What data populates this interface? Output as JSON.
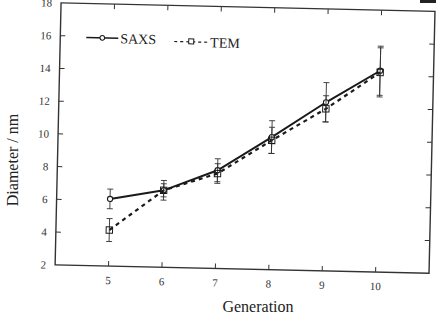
{
  "chart_data": {
    "type": "line",
    "title": "",
    "xlabel": "Generation",
    "ylabel": "Diameter / nm",
    "x": [
      5,
      6,
      7,
      8,
      9,
      10
    ],
    "xlim": [
      4,
      11
    ],
    "ylim": [
      2,
      18
    ],
    "xticks": [
      "5",
      "6",
      "7",
      "8",
      "9",
      "10"
    ],
    "yticks": [
      "2",
      "4",
      "6",
      "8",
      "10",
      "12",
      "14",
      "16",
      "18"
    ],
    "grid": false,
    "legend_position": "upper left",
    "series": [
      {
        "name": "SAXS",
        "style": "solid",
        "marker": "circle",
        "values": [
          6.1,
          6.7,
          8.0,
          10.1,
          12.3,
          14.3
        ],
        "error": [
          0.6,
          0.6,
          0.7,
          1.0,
          1.2,
          1.5
        ]
      },
      {
        "name": "TEM",
        "style": "dashed",
        "marker": "square",
        "values": [
          4.2,
          6.7,
          7.8,
          9.9,
          11.9,
          14.2
        ],
        "error": [
          0.7,
          0.4,
          0.6,
          0.8,
          0.8,
          1.5
        ]
      }
    ]
  },
  "legend": {
    "saxs_label": "SAXS",
    "tem_label": "TEM"
  },
  "colors": {
    "line": "#1a1a1a",
    "axis": "#333333",
    "background": "#ffffff"
  }
}
